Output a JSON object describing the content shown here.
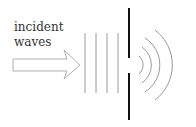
{
  "label": {
    "line1": "incident",
    "line2": "waves"
  },
  "colors": {
    "barrier": "#111111",
    "waves": "#9a9a9a",
    "arrow": "#b0b0b0",
    "text": "#333333"
  }
}
